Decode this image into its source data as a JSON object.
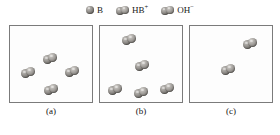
{
  "figure": {
    "caption_style": "lettered",
    "colors": {
      "sphere_light": "#c9c6c2",
      "sphere_mid": "#8b8884",
      "sphere_dark": "#57544f",
      "box_border": "#7b7b7b",
      "background": "#ffffff",
      "text": "#141414"
    }
  },
  "legend": {
    "items": [
      {
        "icon": "sphere-icon",
        "label": "B",
        "sup": "",
        "type": "single"
      },
      {
        "icon": "sphere-pair-icon",
        "label": "HB",
        "sup": "+",
        "type": "pair"
      },
      {
        "icon": "sphere-pair-icon",
        "label": "OH",
        "sup": "−",
        "type": "pair"
      }
    ]
  },
  "panels": [
    {
      "id": "a",
      "caption": "(a)",
      "particles": [
        {
          "type": "single",
          "x": 16,
          "y": 11
        },
        {
          "type": "single",
          "x": 54,
          "y": 12
        },
        {
          "type": "dimer",
          "x": 33,
          "y": 27
        },
        {
          "type": "dimer",
          "x": 11,
          "y": 41
        },
        {
          "type": "dimer",
          "x": 55,
          "y": 40
        },
        {
          "type": "single",
          "x": 10,
          "y": 60
        },
        {
          "type": "dimer",
          "x": 34,
          "y": 58
        },
        {
          "type": "single",
          "x": 62,
          "y": 60
        }
      ]
    },
    {
      "id": "b",
      "caption": "(b)",
      "particles": [
        {
          "type": "dimer",
          "x": 22,
          "y": 8
        },
        {
          "type": "single",
          "x": 58,
          "y": 10
        },
        {
          "type": "single",
          "x": 11,
          "y": 26
        },
        {
          "type": "dimer",
          "x": 35,
          "y": 34
        },
        {
          "type": "single",
          "x": 61,
          "y": 32
        },
        {
          "type": "single",
          "x": 5,
          "y": 42
        },
        {
          "type": "dimer",
          "x": 8,
          "y": 58
        },
        {
          "type": "dimer",
          "x": 34,
          "y": 61
        },
        {
          "type": "dimer",
          "x": 60,
          "y": 57
        }
      ]
    },
    {
      "id": "c",
      "caption": "(c)",
      "particles": [
        {
          "type": "single",
          "x": 30,
          "y": 16
        },
        {
          "type": "dimer",
          "x": 53,
          "y": 12
        },
        {
          "type": "single",
          "x": 6,
          "y": 36
        },
        {
          "type": "dimer",
          "x": 31,
          "y": 38
        },
        {
          "type": "single",
          "x": 63,
          "y": 35
        },
        {
          "type": "single",
          "x": 50,
          "y": 57
        },
        {
          "type": "single",
          "x": 17,
          "y": 63
        }
      ]
    }
  ]
}
